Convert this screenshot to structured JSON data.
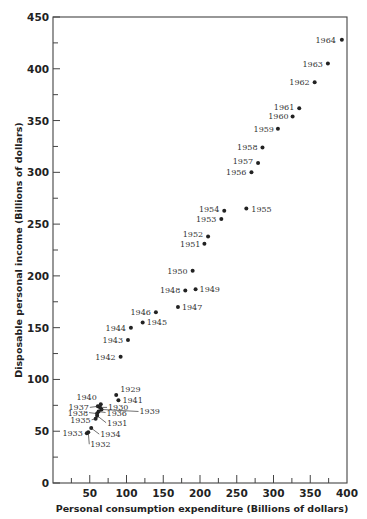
{
  "chart_data": {
    "type": "scatter",
    "title": "",
    "xlabel": "Personal consumption expenditure (Billions of dollars)",
    "ylabel": "Disposable personal income (Billions of dollars)",
    "xlim": [
      0,
      400
    ],
    "ylim": [
      0,
      450
    ],
    "xticks": [
      50,
      100,
      150,
      200,
      250,
      300,
      350,
      400
    ],
    "yticks": [
      0,
      50,
      100,
      150,
      200,
      250,
      300,
      350,
      400,
      450
    ],
    "x_minor_step": 25,
    "y_minor_step": 25,
    "grid": false,
    "legend": null,
    "points": [
      {
        "label": "1929",
        "x": 86,
        "y": 85,
        "lx": 4,
        "ly": -3,
        "anchor": "start"
      },
      {
        "label": "1930",
        "x": 64,
        "y": 73,
        "lx": 8,
        "ly": 3,
        "anchor": "start",
        "leader": true
      },
      {
        "label": "1931",
        "x": 60,
        "y": 65,
        "lx": 10,
        "ly": 10,
        "anchor": "start",
        "leader": true
      },
      {
        "label": "1932",
        "x": 48,
        "y": 49,
        "lx": 2,
        "ly": 15,
        "anchor": "start",
        "leader": true
      },
      {
        "label": "1933",
        "x": 46,
        "y": 48,
        "lx": -4,
        "ly": 3,
        "anchor": "end"
      },
      {
        "label": "1934",
        "x": 52,
        "y": 53,
        "lx": 9,
        "ly": 9,
        "anchor": "start",
        "leader": true
      },
      {
        "label": "1935",
        "x": 58,
        "y": 62,
        "lx": -5,
        "ly": 4,
        "anchor": "end",
        "leader": true
      },
      {
        "label": "1936",
        "x": 62,
        "y": 69,
        "lx": 8,
        "ly": 4,
        "anchor": "start",
        "leader": true
      },
      {
        "label": "1937",
        "x": 61,
        "y": 74,
        "lx": -9,
        "ly": 4,
        "anchor": "end",
        "leader": true
      },
      {
        "label": "1938",
        "x": 60,
        "y": 67,
        "lx": -9,
        "ly": 2,
        "anchor": "end",
        "leader": true
      },
      {
        "label": "1939",
        "x": 66,
        "y": 71,
        "lx": 38,
        "ly": 5,
        "anchor": "start",
        "leader": true
      },
      {
        "label": "1940",
        "x": 65,
        "y": 76,
        "lx": -4,
        "ly": -4,
        "anchor": "end"
      },
      {
        "label": "1941",
        "x": 89,
        "y": 80,
        "lx": 4,
        "ly": 3,
        "anchor": "start"
      },
      {
        "label": "1942",
        "x": 92,
        "y": 122,
        "lx": -5,
        "ly": 3,
        "anchor": "end"
      },
      {
        "label": "1943",
        "x": 102,
        "y": 138,
        "lx": -5,
        "ly": 3,
        "anchor": "end"
      },
      {
        "label": "1944",
        "x": 106,
        "y": 150,
        "lx": -5,
        "ly": 3,
        "anchor": "end"
      },
      {
        "label": "1945",
        "x": 122,
        "y": 155,
        "lx": 4,
        "ly": 3,
        "anchor": "start"
      },
      {
        "label": "1946",
        "x": 140,
        "y": 165,
        "lx": -5,
        "ly": 3,
        "anchor": "end"
      },
      {
        "label": "1947",
        "x": 170,
        "y": 170,
        "lx": 4,
        "ly": 3,
        "anchor": "start"
      },
      {
        "label": "1948",
        "x": 180,
        "y": 186,
        "lx": -5,
        "ly": 3,
        "anchor": "end"
      },
      {
        "label": "1949",
        "x": 194,
        "y": 187,
        "lx": 4,
        "ly": 3,
        "anchor": "start"
      },
      {
        "label": "1950",
        "x": 190,
        "y": 205,
        "lx": -5,
        "ly": 3,
        "anchor": "end"
      },
      {
        "label": "1951",
        "x": 206,
        "y": 231,
        "lx": -4,
        "ly": 3,
        "anchor": "end"
      },
      {
        "label": "1952",
        "x": 211,
        "y": 238,
        "lx": -5,
        "ly": 0,
        "anchor": "end"
      },
      {
        "label": "1953",
        "x": 229,
        "y": 255,
        "lx": -5,
        "ly": 3,
        "anchor": "end"
      },
      {
        "label": "1954",
        "x": 233,
        "y": 263,
        "lx": -5,
        "ly": 1,
        "anchor": "end"
      },
      {
        "label": "1955",
        "x": 263,
        "y": 265,
        "lx": 5,
        "ly": 3,
        "anchor": "start"
      },
      {
        "label": "1956",
        "x": 270,
        "y": 300,
        "lx": -5,
        "ly": 3,
        "anchor": "end"
      },
      {
        "label": "1957",
        "x": 279,
        "y": 309,
        "lx": -5,
        "ly": 1,
        "anchor": "end"
      },
      {
        "label": "1958",
        "x": 285,
        "y": 324,
        "lx": -5,
        "ly": 3,
        "anchor": "end"
      },
      {
        "label": "1959",
        "x": 306,
        "y": 342,
        "lx": -4,
        "ly": 3,
        "anchor": "end"
      },
      {
        "label": "1960",
        "x": 326,
        "y": 354,
        "lx": -4,
        "ly": 3,
        "anchor": "end"
      },
      {
        "label": "1961",
        "x": 335,
        "y": 362,
        "lx": -5,
        "ly": 2,
        "anchor": "end"
      },
      {
        "label": "1962",
        "x": 356,
        "y": 387,
        "lx": -5,
        "ly": 3,
        "anchor": "end"
      },
      {
        "label": "1963",
        "x": 374,
        "y": 405,
        "lx": -5,
        "ly": 3,
        "anchor": "end"
      },
      {
        "label": "1964",
        "x": 393,
        "y": 428,
        "lx": -6,
        "ly": 3,
        "anchor": "end"
      }
    ],
    "colors": {
      "axis": "#444444",
      "point": "#222222",
      "text": "#222222"
    }
  }
}
